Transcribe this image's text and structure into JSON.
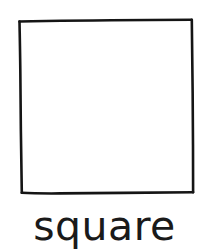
{
  "card": {
    "background_color": "#ffffff",
    "ink_color": "#1a1a1a",
    "label": "square",
    "shape_name": "square-outline",
    "shape_style": "hand-drawn outline, unfilled",
    "stroke_width_px": 2.4,
    "fill": "none",
    "corners": [
      {
        "x": 19,
        "y": 21
      },
      {
        "x": 192,
        "y": 20
      },
      {
        "x": 193,
        "y": 192
      },
      {
        "x": 22,
        "y": 192
      }
    ]
  }
}
